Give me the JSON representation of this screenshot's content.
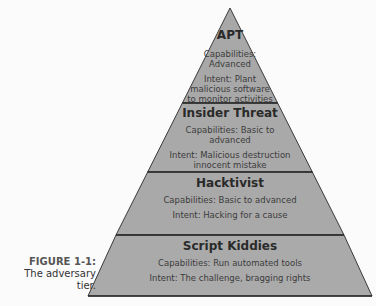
{
  "diagram": {
    "type": "pyramid",
    "colors": {
      "fill": "#a9a9a9",
      "stroke": "#3a3a3a",
      "background": "#fbfbfb"
    },
    "tiers": [
      {
        "title": "APT",
        "capabilities": [
          "Capabilities:",
          "Advanced"
        ],
        "intent": [
          "Intent: Plant",
          "malicious software",
          "to monitor activities"
        ]
      },
      {
        "title": "Insider Threat",
        "capabilities": [
          "Capabilities: Basic to",
          "advanced"
        ],
        "intent": [
          "Intent: Malicious destruction",
          "innocent mistake"
        ]
      },
      {
        "title": "Hacktivist",
        "capabilities": [
          "Capabilities: Basic to advanced"
        ],
        "intent": [
          "Intent: Hacking for a cause"
        ]
      },
      {
        "title": "Script Kiddies",
        "capabilities": [
          "Capabilities: Run automated tools"
        ],
        "intent": [
          "Intent: The challenge, bragging rights"
        ]
      }
    ]
  },
  "caption": {
    "label": "FIGURE 1-1:",
    "text_line1": "The adversary",
    "text_line2": "tier."
  }
}
